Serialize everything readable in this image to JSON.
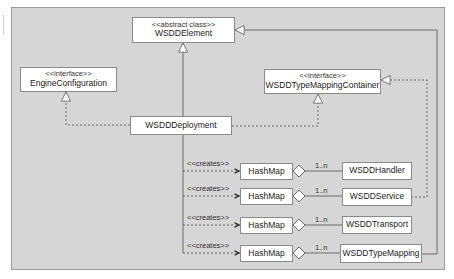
{
  "diagram": {
    "type": "uml-class-diagram",
    "colors": {
      "background": "#d6d6d6",
      "box_fill": "#ffffff",
      "line": "#6a6a6a"
    },
    "classes": [
      {
        "id": "wsdd-element",
        "stereotype": "<<abstract class>>",
        "name": "WSDDElement"
      },
      {
        "id": "engine-configuration",
        "stereotype": "<<interface>>",
        "name": "EngineConfiguration"
      },
      {
        "id": "wsdd-type-mapping-container",
        "stereotype": "<<interface>>",
        "name": "WSDDTypeMappingContainer"
      },
      {
        "id": "wsdd-deployment",
        "name": "WSDDDeployment"
      },
      {
        "id": "hashmap-1",
        "name": "HashMap"
      },
      {
        "id": "hashmap-2",
        "name": "HashMap"
      },
      {
        "id": "hashmap-3",
        "name": "HashMap"
      },
      {
        "id": "hashmap-4",
        "name": "HashMap"
      },
      {
        "id": "wsdd-handler",
        "name": "WSDDHandler"
      },
      {
        "id": "wsdd-service",
        "name": "WSDDService"
      },
      {
        "id": "wsdd-transport",
        "name": "WSDDTransport"
      },
      {
        "id": "wsdd-type-mapping",
        "name": "WSDDTypeMapping"
      }
    ],
    "relations": [
      {
        "from": "WSDDDeployment",
        "to": "WSDDElement",
        "kind": "generalization"
      },
      {
        "from": "WSDDDeployment",
        "to": "EngineConfiguration",
        "kind": "realization"
      },
      {
        "from": "WSDDDeployment",
        "to": "WSDDTypeMappingContainer",
        "kind": "realization"
      },
      {
        "from": "WSDDService",
        "to": "WSDDTypeMappingContainer",
        "kind": "realization"
      },
      {
        "from": "WSDDTypeMapping",
        "to": "WSDDElement",
        "kind": "generalization"
      },
      {
        "from": "WSDDDeployment",
        "to": "HashMap",
        "kind": "dependency",
        "label": "<<creates>>"
      },
      {
        "from": "HashMap",
        "to": "WSDDHandler",
        "kind": "aggregation",
        "multiplicity": "1..n"
      },
      {
        "from": "HashMap",
        "to": "WSDDService",
        "kind": "aggregation",
        "multiplicity": "1..n"
      },
      {
        "from": "HashMap",
        "to": "WSDDTransport",
        "kind": "aggregation",
        "multiplicity": "1..n"
      },
      {
        "from": "HashMap",
        "to": "WSDDTypeMapping",
        "kind": "aggregation",
        "multiplicity": "1..n"
      }
    ],
    "labels": {
      "creates": [
        "<<creates>>",
        "<<creates>>",
        "<<creates>>",
        "<<creates>>"
      ],
      "multiplicity": [
        "1..n",
        "1..n",
        "1..n",
        "1..n"
      ]
    }
  }
}
